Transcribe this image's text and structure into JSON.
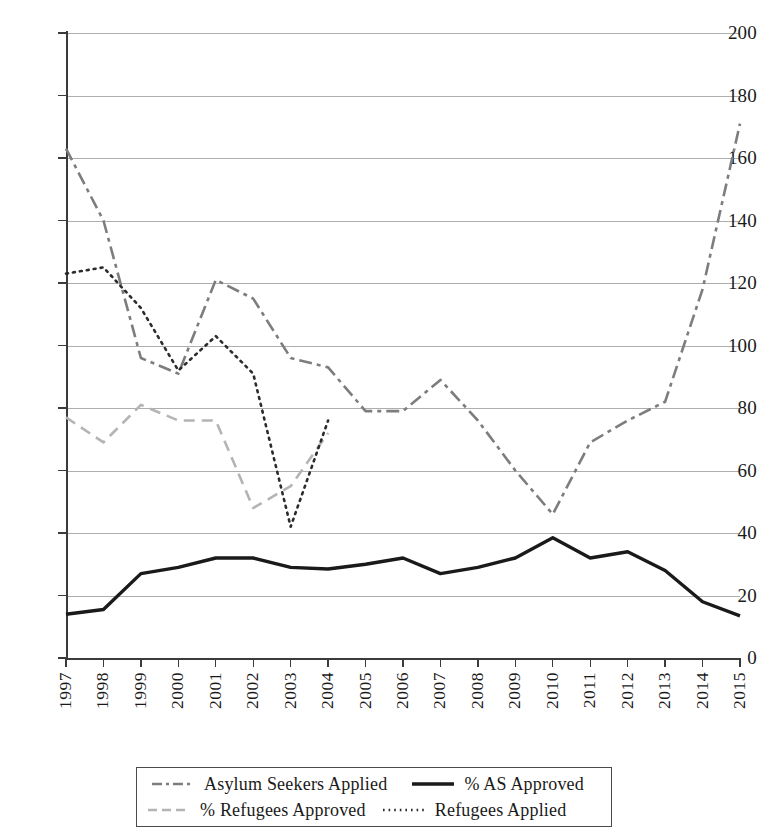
{
  "chart_data": {
    "type": "line",
    "title": "",
    "xlabel": "",
    "ylabel": "",
    "ylim": [
      0,
      200
    ],
    "ytick_step": 20,
    "grid": true,
    "legend_position": "bottom",
    "categories": [
      "1997",
      "1998",
      "1999",
      "2000",
      "2001",
      "2002",
      "2003",
      "2004",
      "2005",
      "2006",
      "2007",
      "2008",
      "2009",
      "2010",
      "2011",
      "2012",
      "2013",
      "2014",
      "2015"
    ],
    "ytick_labels": [
      "200",
      "180",
      "160",
      "140",
      "120",
      "100",
      "80",
      "60",
      "40",
      "20",
      "0"
    ],
    "series": [
      {
        "name": "Asylum Seekers Applied",
        "style": "dash-dot",
        "color": "#7d7d7d",
        "values": [
          163,
          140,
          96,
          91,
          121,
          115,
          96,
          93,
          79,
          79,
          89,
          76,
          60,
          46,
          69,
          76,
          82,
          118,
          171
        ]
      },
      {
        "name": "% AS Approved",
        "style": "solid",
        "color": "#1a1a1a",
        "values": [
          14,
          15.5,
          27,
          29,
          32,
          32,
          29,
          28.5,
          30,
          32,
          27,
          29,
          32,
          38.5,
          32,
          34,
          28,
          18,
          13.5
        ]
      },
      {
        "name": "% Refugees Approved",
        "style": "dashed",
        "color": "#b4b4b4",
        "values": [
          77,
          69,
          81,
          76,
          76,
          48,
          55,
          72,
          null,
          null,
          null,
          null,
          null,
          null,
          null,
          null,
          null,
          null,
          null
        ]
      },
      {
        "name": "Refugees Applied",
        "style": "dotted",
        "color": "#2b2b2b",
        "values": [
          123,
          125,
          112,
          92,
          103,
          91,
          42,
          76,
          null,
          null,
          null,
          null,
          null,
          null,
          null,
          null,
          null,
          null,
          null
        ]
      }
    ]
  },
  "legend": {
    "entries": [
      {
        "label": "Asylum Seekers Applied"
      },
      {
        "label": "% AS Approved"
      },
      {
        "label": "% Refugees Approved"
      },
      {
        "label": "Refugees  Applied"
      }
    ]
  }
}
